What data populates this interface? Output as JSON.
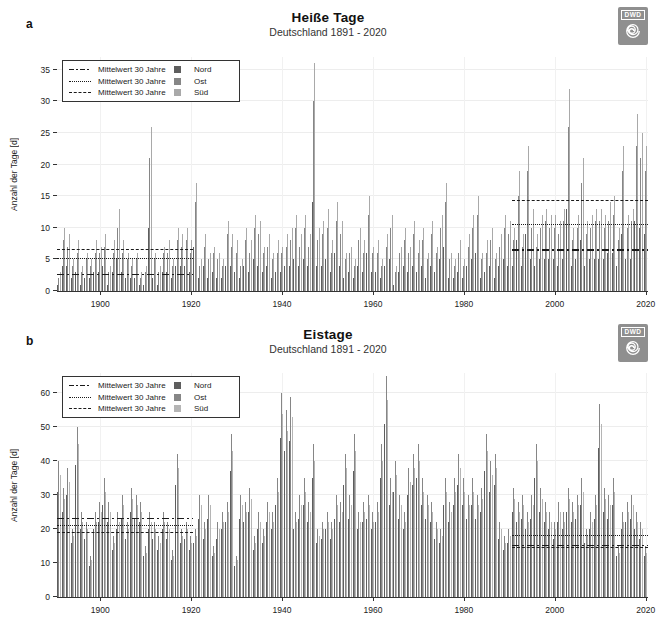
{
  "logo": {
    "text": "DWD"
  },
  "legend": {
    "mean_label": "Mittelwert 30 Jahre"
  },
  "chart_data": [
    {
      "type": "bar",
      "panel_label": "a",
      "title": "Heiße Tage",
      "subtitle": "Deutschland 1891 - 2020",
      "ylabel": "Anzahl der Tage [d]",
      "x_start": 1891,
      "x_end": 2020,
      "xticks": [
        1900,
        1920,
        1940,
        1960,
        1980,
        2000,
        2020
      ],
      "yticks": [
        0,
        5,
        10,
        15,
        20,
        25,
        30,
        35
      ],
      "ylim": [
        0,
        37
      ],
      "grid": true,
      "legend_position": "top-left",
      "series": [
        {
          "name": "Nord",
          "color": "#5e5e5e",
          "values": [
            1,
            4,
            4,
            2,
            3,
            1,
            2,
            2,
            3,
            3,
            4,
            1,
            3,
            5,
            3,
            2,
            2,
            2,
            1,
            1,
            10,
            2,
            1,
            3,
            3,
            2,
            4,
            4,
            4,
            3,
            7,
            2,
            4,
            2,
            3,
            2,
            2,
            4,
            4,
            3,
            2,
            4,
            3,
            5,
            4,
            3,
            4,
            2,
            3,
            3,
            4,
            4,
            5,
            4,
            5,
            4,
            14,
            4,
            4,
            5,
            3,
            6,
            4,
            2,
            3,
            2,
            4,
            3,
            6,
            3,
            3,
            2,
            4,
            5,
            1,
            3,
            4,
            3,
            4,
            3,
            4,
            2,
            4,
            3,
            5,
            7,
            2,
            2,
            3,
            2,
            4,
            5,
            6,
            2,
            3,
            4,
            2,
            4,
            5,
            4,
            4,
            8,
            4,
            9,
            5,
            4,
            5,
            5,
            5,
            5,
            4,
            5,
            13,
            4,
            5,
            8,
            4,
            5,
            5,
            5,
            5,
            6,
            6,
            4,
            9,
            5,
            5,
            11,
            10,
            9
          ]
        },
        {
          "name": "Ost",
          "color": "#868686",
          "values": [
            2,
            8,
            7,
            4,
            6,
            3,
            5,
            4,
            6,
            6,
            7,
            3,
            6,
            10,
            6,
            5,
            4,
            5,
            2,
            3,
            21,
            5,
            3,
            6,
            6,
            4,
            8,
            7,
            8,
            6,
            14,
            4,
            7,
            5,
            6,
            5,
            4,
            9,
            7,
            6,
            4,
            8,
            6,
            10,
            9,
            6,
            7,
            5,
            6,
            6,
            7,
            8,
            10,
            7,
            10,
            7,
            30,
            8,
            9,
            10,
            6,
            11,
            9,
            5,
            6,
            4,
            8,
            6,
            12,
            6,
            6,
            4,
            7,
            10,
            3,
            6,
            8,
            6,
            9,
            6,
            8,
            5,
            9,
            6,
            10,
            14,
            5,
            4,
            6,
            4,
            7,
            10,
            12,
            5,
            6,
            8,
            5,
            7,
            10,
            9,
            8,
            15,
            7,
            19,
            10,
            7,
            10,
            11,
            10,
            10,
            9,
            11,
            26,
            8,
            10,
            17,
            9,
            10,
            11,
            11,
            10,
            11,
            12,
            8,
            19,
            10,
            11,
            23,
            21,
            19
          ]
        },
        {
          "name": "Süd",
          "color": "#a9a9a9",
          "values": [
            3,
            10,
            9,
            5,
            8,
            4,
            6,
            5,
            8,
            7,
            9,
            4,
            8,
            13,
            8,
            6,
            5,
            6,
            3,
            4,
            26,
            6,
            4,
            7,
            8,
            5,
            10,
            9,
            10,
            8,
            17,
            5,
            9,
            6,
            7,
            6,
            5,
            11,
            9,
            8,
            5,
            10,
            8,
            12,
            11,
            7,
            9,
            6,
            8,
            7,
            9,
            10,
            12,
            9,
            12,
            9,
            36,
            10,
            11,
            13,
            8,
            14,
            11,
            6,
            7,
            5,
            10,
            8,
            15,
            7,
            8,
            5,
            9,
            12,
            4,
            7,
            10,
            7,
            11,
            8,
            10,
            6,
            11,
            7,
            12,
            17,
            6,
            5,
            8,
            5,
            9,
            12,
            15,
            6,
            8,
            10,
            6,
            9,
            12,
            11,
            10,
            19,
            9,
            23,
            13,
            9,
            12,
            13,
            12,
            12,
            11,
            13,
            32,
            10,
            12,
            21,
            11,
            12,
            13,
            13,
            12,
            14,
            15,
            10,
            23,
            12,
            13,
            28,
            25,
            23
          ]
        }
      ],
      "mean_lines": [
        {
          "region": "Nord",
          "style": "dashdot",
          "periods": [
            {
              "years": [
                1891,
                1920
              ],
              "value": 2.5
            },
            {
              "years": [
                1991,
                2020
              ],
              "value": 6.4
            }
          ]
        },
        {
          "region": "Ost",
          "style": "dotted",
          "periods": [
            {
              "years": [
                1891,
                1920
              ],
              "value": 5.0
            },
            {
              "years": [
                1991,
                2020
              ],
              "value": 10.5
            }
          ]
        },
        {
          "region": "Süd",
          "style": "dashed",
          "periods": [
            {
              "years": [
                1891,
                1920
              ],
              "value": 6.5
            },
            {
              "years": [
                1991,
                2020
              ],
              "value": 14.3
            }
          ]
        }
      ]
    },
    {
      "type": "bar",
      "panel_label": "b",
      "title": "Eistage",
      "subtitle": "Deutschland 1891 - 2020",
      "ylabel": "Anzahl der Tage [d]",
      "x_start": 1891,
      "x_end": 2020,
      "xticks": [
        1900,
        1920,
        1940,
        1960,
        1980,
        2000,
        2020
      ],
      "yticks": [
        0,
        10,
        20,
        30,
        40,
        50,
        60
      ],
      "ylim": [
        0,
        66
      ],
      "grid": true,
      "legend_position": "top-left",
      "series": [
        {
          "name": "Nord",
          "color": "#5e5e5e",
          "values": [
            31,
            25,
            30,
            16,
            39,
            20,
            17,
            9,
            20,
            22,
            27,
            22,
            14,
            20,
            23,
            17,
            25,
            23,
            22,
            12,
            20,
            17,
            14,
            20,
            17,
            11,
            33,
            16,
            17,
            14,
            16,
            23,
            17,
            23,
            12,
            17,
            20,
            22,
            37,
            9,
            23,
            22,
            25,
            14,
            20,
            16,
            22,
            20,
            27,
            47,
            43,
            46,
            20,
            23,
            27,
            22,
            35,
            16,
            17,
            20,
            17,
            23,
            22,
            33,
            23,
            37,
            20,
            22,
            23,
            20,
            22,
            35,
            51,
            27,
            31,
            23,
            20,
            30,
            33,
            35,
            27,
            23,
            22,
            17,
            16,
            27,
            22,
            27,
            33,
            27,
            23,
            27,
            23,
            25,
            37,
            31,
            33,
            17,
            14,
            16,
            25,
            22,
            23,
            20,
            23,
            35,
            25,
            22,
            20,
            17,
            22,
            20,
            25,
            22,
            23,
            27,
            16,
            20,
            23,
            44,
            25,
            23,
            27,
            12,
            20,
            22,
            23,
            20,
            17,
            12
          ]
        },
        {
          "name": "Ost",
          "color": "#868686",
          "values": [
            40,
            32,
            38,
            20,
            50,
            25,
            22,
            12,
            25,
            28,
            35,
            28,
            18,
            25,
            30,
            22,
            32,
            30,
            28,
            15,
            25,
            22,
            18,
            25,
            22,
            14,
            42,
            20,
            22,
            18,
            20,
            30,
            22,
            30,
            15,
            22,
            25,
            28,
            48,
            12,
            30,
            28,
            32,
            18,
            25,
            20,
            28,
            25,
            35,
            60,
            55,
            59,
            25,
            30,
            35,
            28,
            45,
            20,
            22,
            25,
            22,
            30,
            28,
            42,
            30,
            48,
            25,
            28,
            30,
            25,
            28,
            45,
            65,
            35,
            40,
            30,
            25,
            38,
            42,
            45,
            35,
            30,
            28,
            22,
            20,
            35,
            28,
            35,
            42,
            35,
            30,
            35,
            30,
            32,
            48,
            40,
            42,
            22,
            18,
            20,
            32,
            28,
            30,
            25,
            30,
            45,
            32,
            28,
            25,
            22,
            28,
            25,
            32,
            28,
            30,
            35,
            20,
            25,
            30,
            57,
            32,
            30,
            35,
            15,
            25,
            28,
            30,
            25,
            22,
            15
          ]
        },
        {
          "name": "Süd",
          "color": "#b5b5b5",
          "values": [
            36,
            29,
            34,
            18,
            45,
            22,
            20,
            11,
            22,
            25,
            31,
            25,
            16,
            22,
            27,
            20,
            29,
            27,
            25,
            13,
            22,
            20,
            16,
            22,
            20,
            12,
            38,
            18,
            20,
            16,
            18,
            27,
            20,
            27,
            13,
            20,
            22,
            25,
            43,
            11,
            27,
            25,
            29,
            16,
            22,
            18,
            25,
            22,
            31,
            54,
            49,
            53,
            22,
            27,
            31,
            25,
            40,
            18,
            20,
            22,
            20,
            27,
            25,
            38,
            27,
            43,
            22,
            25,
            27,
            22,
            25,
            40,
            58,
            31,
            36,
            27,
            22,
            34,
            38,
            40,
            31,
            27,
            25,
            20,
            18,
            31,
            25,
            31,
            38,
            31,
            27,
            31,
            27,
            29,
            43,
            36,
            38,
            20,
            16,
            18,
            29,
            25,
            27,
            22,
            27,
            40,
            29,
            25,
            22,
            20,
            25,
            22,
            29,
            25,
            27,
            31,
            18,
            22,
            27,
            51,
            29,
            27,
            31,
            13,
            22,
            25,
            27,
            22,
            20,
            13
          ]
        }
      ],
      "mean_lines": [
        {
          "region": "Nord",
          "style": "dashdot",
          "periods": [
            {
              "years": [
                1891,
                1920
              ],
              "value": 23.0
            },
            {
              "years": [
                1991,
                2020
              ],
              "value": 15.0
            }
          ]
        },
        {
          "region": "Ost",
          "style": "dotted",
          "periods": [
            {
              "years": [
                1891,
                1920
              ],
              "value": 21.0
            },
            {
              "years": [
                1991,
                2020
              ],
              "value": 18.0
            }
          ]
        },
        {
          "region": "Süd",
          "style": "dashed",
          "periods": [
            {
              "years": [
                1891,
                1920
              ],
              "value": 19.0
            },
            {
              "years": [
                1991,
                2020
              ],
              "value": 14.5
            }
          ]
        }
      ]
    }
  ]
}
